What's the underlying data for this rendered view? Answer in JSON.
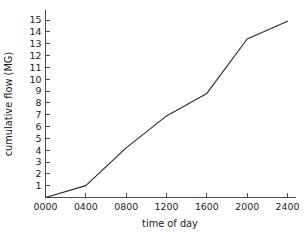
{
  "figure": {
    "background_color": "#ffffff",
    "line_color": "#2b2b2b",
    "axis_color": "#3a3a3a",
    "caption_remnant": ""
  },
  "chart_data": {
    "type": "line",
    "title": "",
    "xlabel": "time of day",
    "ylabel": "cumulative flow (MG)",
    "x": [
      0,
      400,
      800,
      1200,
      1600,
      2000,
      2400
    ],
    "values": [
      0.0,
      1.0,
      4.2,
      6.9,
      8.8,
      13.4,
      14.9
    ],
    "series": [
      {
        "name": "cumulative flow",
        "values": [
          0.0,
          1.0,
          4.2,
          6.9,
          8.8,
          13.4,
          14.9
        ]
      }
    ],
    "x_tick_labels": [
      "0000",
      "0400",
      "0800",
      "1200",
      "1600",
      "2000",
      "2400"
    ],
    "y_tick_labels": [
      "1",
      "2",
      "3",
      "4",
      "5",
      "6",
      "7",
      "8",
      "9",
      "10",
      "11",
      "12",
      "13",
      "14",
      "15"
    ],
    "y_tick_values": [
      1,
      2,
      3,
      4,
      5,
      6,
      7,
      8,
      9,
      10,
      11,
      12,
      13,
      14,
      15
    ],
    "xlim": [
      0,
      2400
    ],
    "ylim": [
      0,
      15.6
    ],
    "grid": false,
    "legend": false,
    "legend_position": "none"
  }
}
